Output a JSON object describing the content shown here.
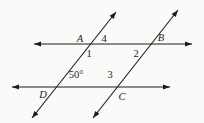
{
  "diagram": {
    "background": "#fafaf9",
    "stroke_color": "#1c1c1c",
    "width": 204,
    "height": 123,
    "lines": [
      {
        "name": "top-parallel-line",
        "x1": 34,
        "y1": 44,
        "x2": 192,
        "y2": 44,
        "arrows": "both"
      },
      {
        "name": "bottom-parallel-line",
        "x1": 12,
        "y1": 87,
        "x2": 170,
        "y2": 87,
        "arrows": "both"
      },
      {
        "name": "left-transversal",
        "x1": 32,
        "y1": 118,
        "x2": 116,
        "y2": 12,
        "arrows": "both"
      },
      {
        "name": "right-transversal",
        "x1": 93,
        "y1": 118,
        "x2": 178,
        "y2": 10,
        "arrows": "both"
      }
    ],
    "labels": [
      {
        "name": "point-label-A",
        "text": "A",
        "x": 80,
        "y": 42,
        "style": "italic"
      },
      {
        "name": "angle-label-4",
        "text": "4",
        "x": 104,
        "y": 42,
        "style": "normal"
      },
      {
        "name": "point-label-B",
        "text": "B",
        "x": 161,
        "y": 41,
        "style": "italic"
      },
      {
        "name": "angle-label-1",
        "text": "1",
        "x": 89,
        "y": 57,
        "style": "normal"
      },
      {
        "name": "angle-label-2",
        "text": "2",
        "x": 136,
        "y": 57,
        "style": "normal"
      },
      {
        "name": "angle-measure-50",
        "text": "50°",
        "x": 76,
        "y": 78,
        "style": "normal"
      },
      {
        "name": "angle-label-3",
        "text": "3",
        "x": 110,
        "y": 78,
        "style": "normal"
      },
      {
        "name": "point-label-D",
        "text": "D",
        "x": 43,
        "y": 98,
        "style": "italic"
      },
      {
        "name": "point-label-C",
        "text": "C",
        "x": 122,
        "y": 100,
        "style": "italic"
      }
    ],
    "arrowhead": {
      "length": 7,
      "half_width": 2.6
    }
  }
}
